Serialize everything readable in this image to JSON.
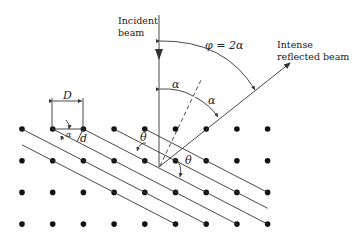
{
  "diagram": {
    "labels": {
      "incident_line1": "Incident",
      "incident_line2": "beam",
      "reflected_line1": "Intense",
      "reflected_line2": "reflected beam",
      "phi_eq": "φ = 2α",
      "alpha": "α",
      "theta": "θ",
      "D": "D",
      "d": "d"
    },
    "lattice": {
      "rows": 4,
      "columns": 9
    },
    "colors": {
      "ink": "#222222",
      "dots": "#111111",
      "background": "#ffffff"
    }
  }
}
